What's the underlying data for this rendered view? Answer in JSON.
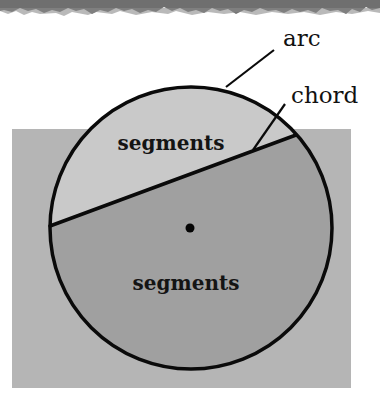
{
  "diagram": {
    "type": "circle-parts",
    "labels": {
      "arc": "arc",
      "chord": "chord",
      "segment_upper": "segments",
      "segment_lower": "segments"
    },
    "colors": {
      "background": "#ffffff",
      "torn_edge": "#6e6e6e",
      "square_fill": "#b5b5b5",
      "upper_segment_fill": "#c9c9c9",
      "lower_segment_fill": "#a0a0a0",
      "stroke": "#0a0a0a"
    },
    "geometry": {
      "circle": {
        "cx": 191,
        "cy": 228,
        "r": 141
      },
      "chord": {
        "x1": 50,
        "y1": 226,
        "x2": 296,
        "y2": 135
      },
      "center_point": {
        "cx": 190,
        "cy": 228,
        "r": 4.5
      },
      "square": {
        "x": 12,
        "y": 129,
        "width": 339,
        "height": 259
      }
    }
  }
}
